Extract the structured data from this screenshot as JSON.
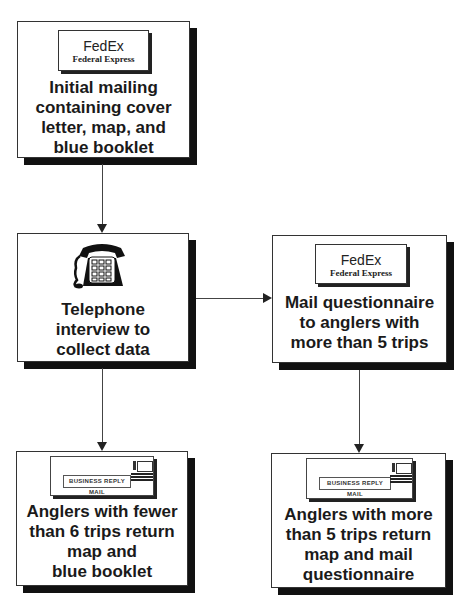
{
  "diagram": {
    "nodes": [
      {
        "id": "initial-mailing",
        "icon": "fedex-label-icon",
        "icon_text": {
          "logo": "FedEx",
          "subtitle": "Federal Express"
        },
        "lines": [
          "Initial mailing",
          "containing cover",
          "letter, map, and",
          "blue booklet"
        ]
      },
      {
        "id": "telephone-interview",
        "icon": "telephone-icon",
        "lines": [
          "Telephone",
          "interview to",
          "collect data"
        ]
      },
      {
        "id": "mail-questionnaire",
        "icon": "fedex-label-icon",
        "icon_text": {
          "logo": "FedEx",
          "subtitle": "Federal Express"
        },
        "lines": [
          "Mail questionnaire",
          "to anglers with",
          "more than 5 trips"
        ]
      },
      {
        "id": "fewer-than-6-return",
        "icon": "business-reply-envelope-icon",
        "icon_text": {
          "label": "BUSINESS REPLY MAIL"
        },
        "lines": [
          "Anglers with fewer",
          "than 6 trips return",
          "map and",
          "blue booklet"
        ]
      },
      {
        "id": "more-than-5-return",
        "icon": "business-reply-envelope-icon",
        "icon_text": {
          "label": "BUSINESS REPLY MAIL"
        },
        "lines": [
          "Anglers with more",
          "than 5 trips return",
          "map and mail",
          "questionnaire"
        ]
      }
    ],
    "edges": [
      {
        "from": "initial-mailing",
        "to": "telephone-interview",
        "direction": "down"
      },
      {
        "from": "telephone-interview",
        "to": "mail-questionnaire",
        "direction": "right"
      },
      {
        "from": "telephone-interview",
        "to": "fewer-than-6-return",
        "direction": "down"
      },
      {
        "from": "mail-questionnaire",
        "to": "more-than-5-return",
        "direction": "down"
      }
    ]
  }
}
